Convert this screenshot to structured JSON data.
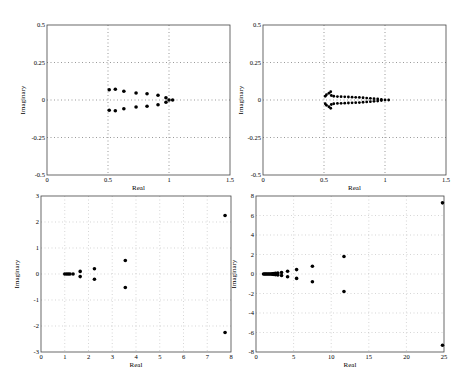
{
  "chart_data": [
    {
      "type": "scatter",
      "title": "",
      "xlabel": "Real",
      "ylabel": "Imaginary",
      "xlim": [
        0,
        1.5
      ],
      "ylim": [
        -0.5,
        0.5
      ],
      "xticks": [
        "0",
        "0.5",
        "1",
        "1.5"
      ],
      "yticks": [
        "-0.5",
        "-0.25",
        "0",
        "0.25",
        "0.5"
      ],
      "grid": "dotted at x=0.5,1 and y=-0.25,0,0.25",
      "box": {
        "x0": 47,
        "x1": 230,
        "y0": 25,
        "y1": 175
      },
      "points": [
        [
          0.51,
          0.068
        ],
        [
          0.51,
          -0.068
        ],
        [
          0.56,
          0.072
        ],
        [
          0.56,
          -0.072
        ],
        [
          0.63,
          0.058
        ],
        [
          0.63,
          -0.058
        ],
        [
          0.73,
          0.047
        ],
        [
          0.73,
          -0.047
        ],
        [
          0.82,
          0.042
        ],
        [
          0.82,
          -0.042
        ],
        [
          0.91,
          0.032
        ],
        [
          0.91,
          -0.032
        ],
        [
          0.975,
          0.015
        ],
        [
          0.975,
          -0.015
        ],
        [
          1.0,
          0.0
        ],
        [
          1.03,
          0.0
        ]
      ]
    },
    {
      "type": "scatter",
      "title": "",
      "xlabel": "Real",
      "ylabel": "Imaginary",
      "xlim": [
        0,
        1.5
      ],
      "ylim": [
        -0.5,
        0.5
      ],
      "xticks": [
        "0",
        "0.5",
        "1",
        "1.5"
      ],
      "yticks": [
        "-0.5",
        "-0.25",
        "0",
        "0.25",
        "0.5"
      ],
      "grid": "dotted at x=0.5,1 and y=-0.25,0,0.25",
      "box": {
        "x0": 263,
        "x1": 446,
        "y0": 25,
        "y1": 175
      },
      "points": [
        [
          0.51,
          0.025
        ],
        [
          0.51,
          -0.025
        ],
        [
          0.52,
          0.035
        ],
        [
          0.52,
          -0.035
        ],
        [
          0.54,
          0.045
        ],
        [
          0.54,
          -0.045
        ],
        [
          0.555,
          0.055
        ],
        [
          0.555,
          -0.055
        ],
        [
          0.56,
          0.03
        ],
        [
          0.56,
          -0.03
        ],
        [
          0.58,
          0.025
        ],
        [
          0.58,
          -0.025
        ],
        [
          0.61,
          0.023
        ],
        [
          0.61,
          -0.023
        ],
        [
          0.64,
          0.022
        ],
        [
          0.64,
          -0.022
        ],
        [
          0.67,
          0.021
        ],
        [
          0.67,
          -0.021
        ],
        [
          0.7,
          0.02
        ],
        [
          0.7,
          -0.02
        ],
        [
          0.73,
          0.019
        ],
        [
          0.73,
          -0.019
        ],
        [
          0.76,
          0.018
        ],
        [
          0.76,
          -0.018
        ],
        [
          0.79,
          0.017
        ],
        [
          0.79,
          -0.017
        ],
        [
          0.82,
          0.015
        ],
        [
          0.82,
          -0.015
        ],
        [
          0.85,
          0.013
        ],
        [
          0.85,
          -0.013
        ],
        [
          0.88,
          0.011
        ],
        [
          0.88,
          -0.011
        ],
        [
          0.91,
          0.009
        ],
        [
          0.91,
          -0.009
        ],
        [
          0.94,
          0.007
        ],
        [
          0.94,
          -0.007
        ],
        [
          0.97,
          0.004
        ],
        [
          0.97,
          -0.004
        ],
        [
          1.0,
          0.0
        ],
        [
          1.03,
          0.0
        ]
      ]
    },
    {
      "type": "scatter",
      "title": "",
      "xlabel": "Real",
      "ylabel": "Imaginary",
      "xlim": [
        0,
        8
      ],
      "ylim": [
        -3,
        3
      ],
      "xticks": [
        "0",
        "1",
        "2",
        "3",
        "4",
        "5",
        "6",
        "7",
        "8"
      ],
      "yticks": [
        "-3",
        "-2",
        "-1",
        "0",
        "1",
        "2",
        "3"
      ],
      "grid": "dotted at every tick",
      "box": {
        "x0": 41,
        "x1": 231,
        "y0": 196,
        "y1": 352
      },
      "points": [
        [
          1.0,
          0.0
        ],
        [
          1.08,
          0.0
        ],
        [
          1.15,
          0.0
        ],
        [
          1.22,
          0.0
        ],
        [
          1.35,
          0.0
        ],
        [
          1.65,
          0.1
        ],
        [
          1.65,
          -0.1
        ],
        [
          2.25,
          0.2
        ],
        [
          2.25,
          -0.2
        ],
        [
          3.55,
          0.52
        ],
        [
          3.55,
          -0.52
        ],
        [
          7.75,
          2.25
        ],
        [
          7.75,
          -2.25
        ]
      ]
    },
    {
      "type": "scatter",
      "title": "",
      "xlabel": "Real",
      "ylabel": "Imaginary",
      "xlim": [
        0,
        25
      ],
      "ylim": [
        -8,
        8
      ],
      "xticks": [
        "0",
        "5",
        "10",
        "15",
        "20",
        "25"
      ],
      "yticks": [
        "-8",
        "-6",
        "-4",
        "-2",
        "0",
        "2",
        "4",
        "6",
        "8"
      ],
      "grid": "dotted at every tick",
      "box": {
        "x0": 256,
        "x1": 444,
        "y0": 196,
        "y1": 352
      },
      "points": [
        [
          1.0,
          0.0
        ],
        [
          1.15,
          0.0
        ],
        [
          1.3,
          0.0
        ],
        [
          1.45,
          0.0
        ],
        [
          1.6,
          0.0
        ],
        [
          1.75,
          0.0
        ],
        [
          1.9,
          0.0
        ],
        [
          2.05,
          0.0
        ],
        [
          2.2,
          0.02
        ],
        [
          2.2,
          -0.02
        ],
        [
          2.4,
          0.04
        ],
        [
          2.4,
          -0.04
        ],
        [
          2.6,
          0.06
        ],
        [
          2.6,
          -0.06
        ],
        [
          2.9,
          0.1
        ],
        [
          2.9,
          -0.1
        ],
        [
          3.4,
          0.15
        ],
        [
          3.4,
          -0.15
        ],
        [
          4.2,
          0.28
        ],
        [
          4.2,
          -0.28
        ],
        [
          5.4,
          0.45
        ],
        [
          5.4,
          -0.45
        ],
        [
          7.5,
          0.8
        ],
        [
          7.5,
          -0.8
        ],
        [
          11.7,
          1.8
        ],
        [
          11.7,
          -1.8
        ],
        [
          24.8,
          7.3
        ],
        [
          24.8,
          -7.3
        ]
      ]
    }
  ]
}
